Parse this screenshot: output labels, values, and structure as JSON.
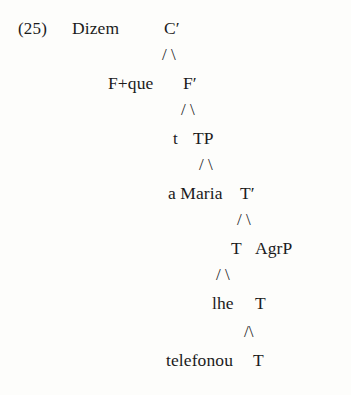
{
  "figure": {
    "example_number": "(25)",
    "top_word": "Dizem"
  },
  "tree": {
    "nodes": [
      {
        "id": "c-bar",
        "label": "C′",
        "row": 0
      },
      {
        "id": "f-que",
        "label": "F+que",
        "row": 1
      },
      {
        "id": "f-bar",
        "label": "F′",
        "row": 1
      },
      {
        "id": "trace-t",
        "label": "t",
        "row": 2
      },
      {
        "id": "tp",
        "label": "TP",
        "row": 2
      },
      {
        "id": "a-maria",
        "label": "a Maria",
        "row": 3
      },
      {
        "id": "t-bar",
        "label": "T′",
        "row": 3
      },
      {
        "id": "t-head-1",
        "label": "T",
        "row": 4
      },
      {
        "id": "agrp",
        "label": "AgrP",
        "row": 4
      },
      {
        "id": "lhe",
        "label": "lhe",
        "row": 5
      },
      {
        "id": "t-head-2",
        "label": "T",
        "row": 5
      },
      {
        "id": "telefonou",
        "label": "telefonou",
        "row": 6
      },
      {
        "id": "t-head-3",
        "label": "T",
        "row": 6
      }
    ],
    "branches": [
      {
        "id": "branch-c",
        "glyphs": "/ \\"
      },
      {
        "id": "branch-f",
        "glyphs": "/ \\"
      },
      {
        "id": "branch-tp",
        "glyphs": "/ \\"
      },
      {
        "id": "branch-tbar",
        "glyphs": "/ \\"
      },
      {
        "id": "branch-t1",
        "glyphs": "/ \\"
      },
      {
        "id": "branch-t2",
        "glyphs": "/\\"
      }
    ]
  },
  "colors": {
    "background": "#fdfdfb",
    "text": "#1b1b1b"
  }
}
